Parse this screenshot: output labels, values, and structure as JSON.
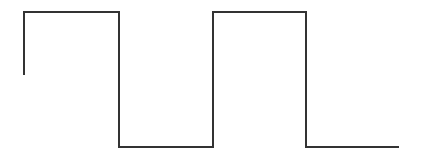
{
  "diagram": {
    "type": "square-wave",
    "stroke_color": "#333333",
    "stroke_width": 2,
    "background": "#ffffff",
    "points": [
      [
        24,
        75
      ],
      [
        24,
        12
      ],
      [
        119,
        12
      ],
      [
        119,
        147
      ],
      [
        213,
        147
      ],
      [
        213,
        12
      ],
      [
        306,
        12
      ],
      [
        306,
        147
      ],
      [
        399,
        147
      ]
    ],
    "segments": [
      {
        "level": "mid-to-high",
        "x_start": 24,
        "x_end": 24
      },
      {
        "level": "high",
        "x_start": 24,
        "x_end": 119
      },
      {
        "level": "low",
        "x_start": 119,
        "x_end": 213
      },
      {
        "level": "high",
        "x_start": 213,
        "x_end": 306
      },
      {
        "level": "low",
        "x_start": 306,
        "x_end": 399
      }
    ]
  }
}
